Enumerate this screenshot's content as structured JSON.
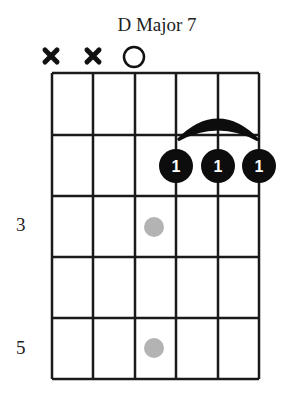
{
  "chord": {
    "title": "D Major 7",
    "strings": 6,
    "frets_shown": 5,
    "string_markers": [
      "x",
      "x",
      "o",
      "",
      "",
      ""
    ],
    "fret_labels": [
      {
        "fret": 3,
        "label": "3"
      },
      {
        "fret": 5,
        "label": "5"
      }
    ],
    "fingers": [
      {
        "string": 4,
        "fret": 2,
        "finger": "1"
      },
      {
        "string": 5,
        "fret": 2,
        "finger": "1"
      },
      {
        "string": 6,
        "fret": 2,
        "finger": "1"
      }
    ],
    "barre": {
      "from_string": 4,
      "to_string": 6,
      "fret": 2
    },
    "inlay_markers": [
      {
        "fret": 3,
        "between_strings": 3
      },
      {
        "fret": 5,
        "between_strings": 3
      }
    ],
    "colors": {
      "line": "#1a1a1a",
      "dot": "#0d0d0d",
      "inlay": "#b3b3b3",
      "finger_text": "#ffffff"
    }
  }
}
